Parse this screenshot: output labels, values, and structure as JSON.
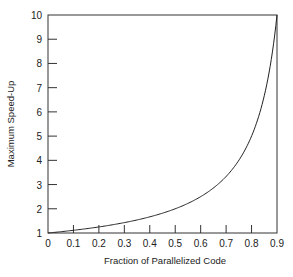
{
  "chart_data": {
    "type": "line",
    "title": "",
    "xlabel": "Fraction of Parallelized Code",
    "ylabel": "Maximum Speed-Up",
    "xlim": [
      0,
      0.9
    ],
    "ylim": [
      1,
      10
    ],
    "grid": false,
    "legend": null,
    "x_ticks": [
      "0",
      "0.1",
      "0.2",
      "0.3",
      "0.4",
      "0.5",
      "0.6",
      "0.7",
      "0.8",
      "0.9"
    ],
    "y_ticks": [
      "1",
      "2",
      "3",
      "4",
      "5",
      "6",
      "7",
      "8",
      "9",
      "10"
    ],
    "series": [
      {
        "name": "Speed-up = 1/(1-f)",
        "x": [
          0,
          0.1,
          0.2,
          0.3,
          0.4,
          0.5,
          0.6,
          0.7,
          0.8,
          0.85,
          0.9
        ],
        "y": [
          1.0,
          1.11,
          1.25,
          1.43,
          1.67,
          2.0,
          2.5,
          3.33,
          5.0,
          6.67,
          10.0
        ]
      }
    ],
    "colors": {
      "line": "#222222",
      "axis": "#333333"
    }
  }
}
